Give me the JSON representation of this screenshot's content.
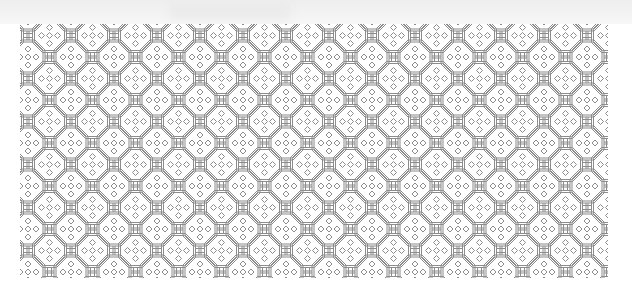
{
  "image": {
    "description": "Lattice pattern of octagons with quatrefoil knots",
    "colors": {
      "background": "#ffffff",
      "line": "#8c8c8c",
      "top_wash": "#eeeeee"
    },
    "tile_size_px": 43
  }
}
